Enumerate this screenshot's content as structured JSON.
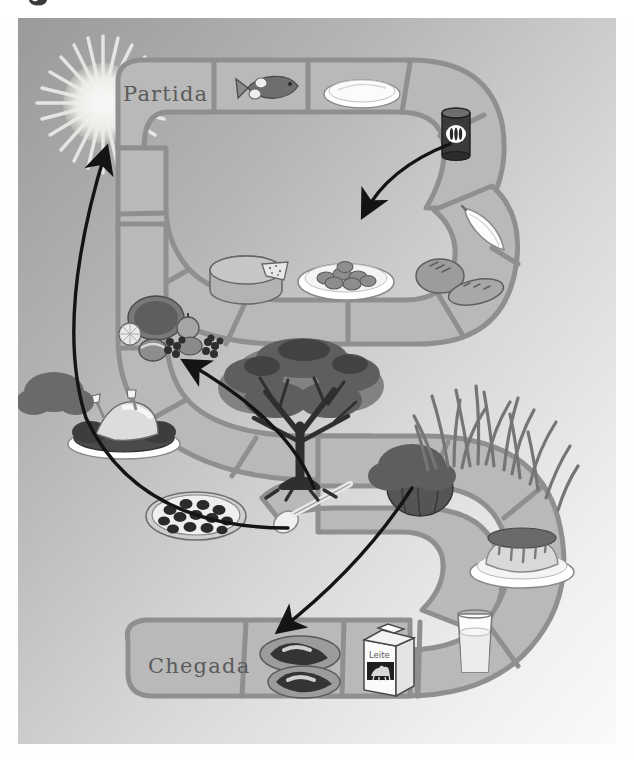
{
  "document": {
    "title": "Jogo de Tabuleiro dos Alimentos",
    "language": "Portuguese",
    "width": 634,
    "height": 760
  },
  "colors": {
    "background_top_left": "#9a9a9a",
    "background_bottom_right": "#f8f8f8",
    "board_fill": "#b9b9b9",
    "board_border": "#8f8f8f",
    "cell_divider": "#8f8f8f",
    "arrow": "#1a1a1a",
    "text": "#5b5b5b",
    "sun": "#f2f2ee",
    "tree_dark": "#3c3c3c",
    "tree_mid": "#6e6e6e",
    "grass": "#7d7d7d",
    "white": "#ffffff"
  },
  "board": {
    "shape": "serpentine-s-path",
    "rows": 3,
    "start_label": "Partida",
    "finish_label": "Chegada"
  },
  "cells": [
    {
      "index": 0,
      "row": "top",
      "label": "Partida",
      "icon": "",
      "icon_name": "start-cell"
    },
    {
      "index": 1,
      "row": "top",
      "label": "",
      "icon": "fish",
      "icon_name": "fish-icon"
    },
    {
      "index": 2,
      "row": "top",
      "label": "",
      "icon": "plate",
      "icon_name": "empty-plate-icon"
    },
    {
      "index": 3,
      "row": "top",
      "label": "",
      "icon": "can",
      "icon_name": "canned-food-icon"
    },
    {
      "index": 4,
      "row": "top",
      "label": "",
      "icon": "banana",
      "icon_name": "banana-icon"
    },
    {
      "index": 5,
      "row": "middle",
      "label": "",
      "icon": "bread",
      "icon_name": "bread-icon"
    },
    {
      "index": 6,
      "row": "middle",
      "label": "",
      "icon": "pasta-plate",
      "icon_name": "pasta-plate-icon"
    },
    {
      "index": 7,
      "row": "middle",
      "label": "",
      "icon": "cheese",
      "icon_name": "cheese-wheel-icon"
    },
    {
      "index": 8,
      "row": "middle",
      "label": "",
      "icon": "fruits",
      "icon_name": "fruits-icon"
    },
    {
      "index": 9,
      "row": "middle",
      "label": "",
      "icon": "roast-chicken",
      "icon_name": "roast-chicken-icon"
    },
    {
      "index": 10,
      "row": "middle",
      "label": "",
      "icon": "pizza",
      "icon_name": "pizza-icon"
    },
    {
      "index": 11,
      "row": "middle",
      "label": "",
      "icon": "spoon",
      "icon_name": "spoon-icon"
    },
    {
      "index": 12,
      "row": "middle",
      "label": "",
      "icon": "pumpkin",
      "icon_name": "pumpkin-icon"
    },
    {
      "index": 13,
      "row": "middle",
      "label": "",
      "icon": "pudding",
      "icon_name": "pudding-icon"
    },
    {
      "index": 14,
      "row": "bottom",
      "label": "",
      "icon": "milk-glass",
      "icon_name": "milk-glass-icon"
    },
    {
      "index": 15,
      "row": "bottom",
      "label": "",
      "icon": "milk-carton",
      "icon_name": "milk-carton-icon"
    },
    {
      "index": 16,
      "row": "bottom",
      "label": "",
      "icon": "meat",
      "icon_name": "meat-cuts-icon"
    },
    {
      "index": 17,
      "row": "bottom",
      "label": "Chegada",
      "icon": "",
      "icon_name": "finish-cell"
    }
  ],
  "labels": {
    "milk_carton_text": "Leite"
  },
  "decorations": [
    {
      "name": "sun",
      "position": "top-left",
      "rays": 28
    },
    {
      "name": "tree",
      "position": "center"
    },
    {
      "name": "shrub",
      "position": "center-right"
    },
    {
      "name": "grass",
      "position": "right-middle"
    }
  ],
  "arrows": [
    {
      "name": "arrow-to-start",
      "from": "middle-left-fruits",
      "to": "top-left-partida",
      "direction": "up-left"
    },
    {
      "name": "arrow-to-pasta",
      "from": "can-cell",
      "to": "pasta-plate-cell",
      "direction": "down-left"
    },
    {
      "name": "arrow-to-fruits",
      "from": "tree-center",
      "to": "fruits-cell",
      "direction": "up-left"
    },
    {
      "name": "arrow-to-meat",
      "from": "pumpkin-cell",
      "to": "meat-cell",
      "direction": "down-left"
    }
  ]
}
